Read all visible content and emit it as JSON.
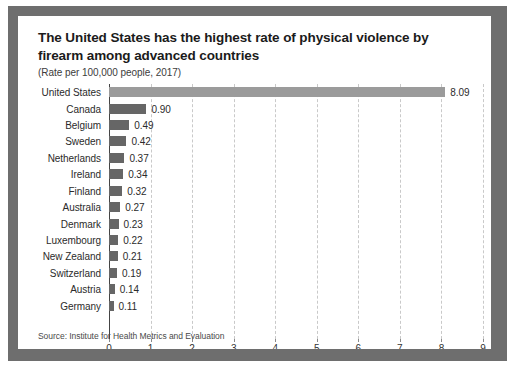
{
  "chart_data": {
    "type": "bar",
    "orientation": "horizontal",
    "title": "The United States has the highest rate of physical violence by firearm among advanced countries",
    "subtitle": "(Rate per 100,000 people, 2017)",
    "source": "Source: Institute for Health Metrics and Evaluation",
    "xlabel": "",
    "ylabel": "",
    "xlim": [
      0,
      9
    ],
    "xticks": [
      "0",
      "1",
      "2",
      "3",
      "4",
      "5",
      "6",
      "7",
      "8",
      "9"
    ],
    "grid": true,
    "legend": false,
    "highlight_category": "United States",
    "colors": {
      "bar": "#666666",
      "bar_highlight": "#9b9b9b",
      "frame": "#6e6e6e",
      "card": "#ffffff",
      "gridline": "#c9c9c9",
      "axis": "#444444",
      "text": "#2b2b2b"
    },
    "categories": [
      "United States",
      "Canada",
      "Belgium",
      "Sweden",
      "Netherlands",
      "Ireland",
      "Finland",
      "Australia",
      "Denmark",
      "Luxembourg",
      "New Zealand",
      "Switzerland",
      "Austria",
      "Germany"
    ],
    "values": [
      8.09,
      0.9,
      0.49,
      0.42,
      0.37,
      0.34,
      0.32,
      0.27,
      0.23,
      0.22,
      0.21,
      0.19,
      0.14,
      0.11
    ],
    "value_labels": [
      "8.09",
      "0.90",
      "0.49",
      "0.42",
      "0.37",
      "0.34",
      "0.32",
      "0.27",
      "0.23",
      "0.22",
      "0.21",
      "0.19",
      "0.14",
      "0.11"
    ]
  }
}
